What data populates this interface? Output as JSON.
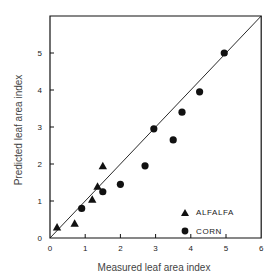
{
  "chart_data": {
    "type": "scatter",
    "title": "",
    "xlabel": "Measured leaf area index",
    "ylabel": "Predicted leaf area index",
    "xlim": [
      0,
      6
    ],
    "ylim": [
      0,
      6
    ],
    "xticks": [
      "0",
      "1",
      "2",
      "3",
      "4",
      "5",
      "6"
    ],
    "yticks": [
      "0",
      "1",
      "2",
      "3",
      "4",
      "5"
    ],
    "grid": false,
    "reference_line": "1:1",
    "legend_position": "lower right inside",
    "series": [
      {
        "name": "ALFALFA",
        "marker": "triangle",
        "points": [
          [
            0.2,
            0.3
          ],
          [
            0.7,
            0.4
          ],
          [
            1.2,
            1.05
          ],
          [
            1.35,
            1.4
          ],
          [
            1.5,
            1.95
          ]
        ]
      },
      {
        "name": "CORN",
        "marker": "circle",
        "points": [
          [
            0.9,
            0.8
          ],
          [
            1.5,
            1.25
          ],
          [
            2.0,
            1.45
          ],
          [
            2.7,
            1.95
          ],
          [
            2.95,
            2.95
          ],
          [
            3.5,
            2.65
          ],
          [
            3.75,
            3.4
          ],
          [
            4.25,
            3.95
          ],
          [
            4.95,
            5.0
          ]
        ]
      }
    ]
  },
  "colors": {
    "ink": "#111111",
    "label": "#444444"
  }
}
